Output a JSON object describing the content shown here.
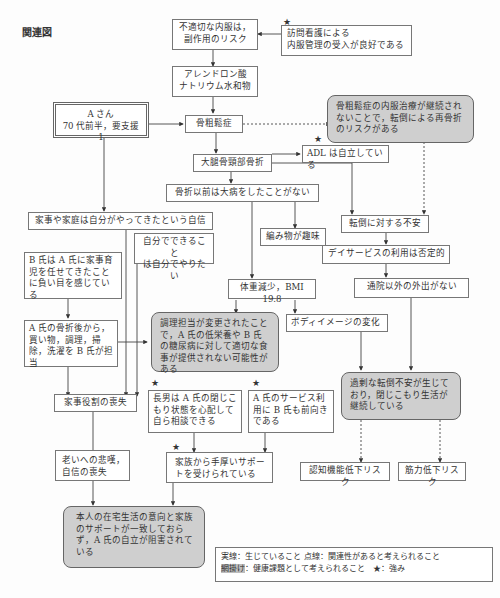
{
  "page": {
    "section_label": "関連図"
  },
  "nodes": {
    "improper_medication": "不適切な内服は，\n副作用のリスク",
    "visiting_nurse": "訪問看護による\n内服管理の受入が良好である",
    "alendronate": "アレンドロン酸\nナトリウム水和物",
    "patient": "A さん\n70 代前半，要支援 1",
    "osteoporosis": "骨粗鬆症",
    "refracture_risk": "骨粗鬆症の内服治療が継続されないことで，転倒による再骨折のリスクがある",
    "femoral_fracture": "大腿骨頸部骨折",
    "adl_independent": "ADL は自立している",
    "no_major_illness": "骨折以前は大病をしたことがない",
    "housework_confidence": "家事や家庭は自分がやってきたという自信",
    "knitting_hobby": "編み物が趣味",
    "fear_of_falling": "転倒に対する不安",
    "do_myself": "自分でできること\nは自分でやりたい",
    "b_guilt": "B 氏は A 氏に家事育児を任せてきたことに負い目を感じている",
    "day_service_negative": "デイサービスの利用は否定的",
    "weight_loss": "体重減少，BMI 19.8",
    "no_outings": "通院以外の外出がない",
    "b_takes_over": "A 氏の骨折後から，買い物，調理，掃除，洗濯を B 氏が担当",
    "nutrition_issue": "調理担当が変更されたことで，A 氏の低栄養や B 氏の糖尿病に対して適切な食事が提供されない可能性がある",
    "body_image": "ボディイメージの変化",
    "loss_of_role": "家事役割の喪失",
    "eldest_son": "長男は A 氏の閉じこもり状態を心配して自ら相談できる",
    "b_positive": "A 氏のサービス利用に B 氏も前向きである",
    "withdrawal": "過剰な転倒不安が生じており，閉じこもり生活が継続している",
    "grief_aging": "老いへの悲嘆，\n自信の喪失",
    "family_support": "家族から手厚いサポートを受けられている",
    "cognitive_risk": "認知機能低下リスク",
    "muscle_risk": "筋力低下リスク",
    "independence_hindered": "本人の在宅生活の意向と家族のサポートが一致しておらず，A 氏の自立が阻害されている"
  },
  "legend": {
    "line1": "実線：生じていること 点線：関連性があると考えられること",
    "shaded_label": "網掛け",
    "line2_rest": "：健康課題として考えられること　★：強み"
  },
  "icons": {
    "strength": "★"
  },
  "colors": {
    "issue_fill": "#cfcfcf",
    "border": "#777777",
    "text": "#333333"
  }
}
